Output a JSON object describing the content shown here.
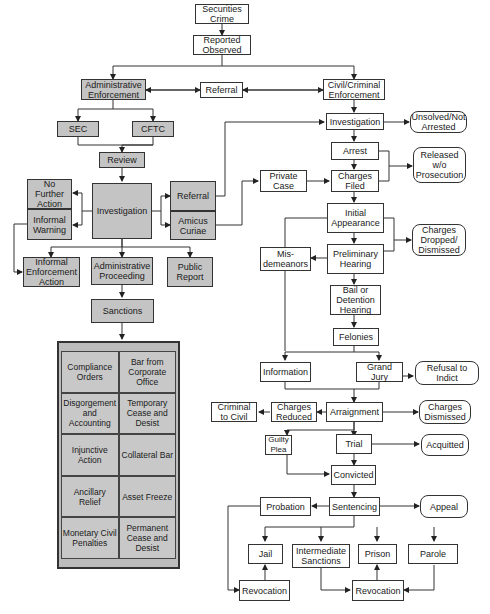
{
  "diagram": {
    "colors": {
      "admin_fill": "#c4c4c4",
      "criminal_fill": "#ffffff",
      "line": "#333333"
    },
    "nodes": {
      "securities_crime": "Securities Crime",
      "reported": "Reported Observed",
      "admin_enforcement": "Administrative Enforcement",
      "referral_top": "Referral",
      "civil_criminal": "Civil/Criminal Enforcement",
      "sec": "SEC",
      "cftc": "CFTC",
      "review": "Review",
      "no_further_action": "No Further Action",
      "informal_warning": "Informal Warning",
      "admin_investigation": "Investigation",
      "referral_admin": "Referral",
      "amicus_curiae": "Amicus Curiae",
      "informal_enforcement": "Informal Enforcement Action",
      "admin_proceeding": "Administrative Proceeding",
      "public_report": "Public Report",
      "sanctions": "Sanctions",
      "investigation": "Investigation",
      "unsolved": "Unsolved/Not Arrested",
      "arrest": "Arrest",
      "released": "Released w/o Prosecution",
      "private_case": "Private Case",
      "charges_filed": "Charges Filed",
      "initial_appearance": "Initial Appearance",
      "charges_dropped": "Charges Dropped/ Dismissed",
      "misdemeanors": "Mis- demeanors",
      "preliminary_hearing": "Preliminary Hearing",
      "bail_hearing": "Bail or Detention Hearing",
      "felonies": "Felonies",
      "information": "Information",
      "grand_jury": "Grand Jury",
      "refusal_indict": "Refusal to Indict",
      "criminal_to_civil": "Criminal to Civil",
      "charges_reduced": "Charges Reduced",
      "arraignment": "Arraignment",
      "charges_dismissed": "Charges Dismissed",
      "guilty_plea": "Guilty Plea",
      "trial": "Trial",
      "acquitted": "Acquitted",
      "convicted": "Convicted",
      "probation": "Probation",
      "sentencing": "Sentencing",
      "appeal": "Appeal",
      "jail": "Jail",
      "intermediate_sanctions": "Intermediate Sanctions",
      "prison": "Prison",
      "parole": "Parole",
      "revocation_left": "Revocation",
      "revocation_right": "Revocation"
    },
    "sanctions_table": [
      [
        "Compliance Orders",
        "Bar from Corporate Office"
      ],
      [
        "Disgorgement and Accounting",
        "Temporary Cease and Desist"
      ],
      [
        "Injunctive Action",
        "Collateral Bar"
      ],
      [
        "Ancillary Relief",
        "Asset Freeze"
      ],
      [
        "Monetary Civil Penalties",
        "Permanent Cease and Desist"
      ]
    ]
  }
}
